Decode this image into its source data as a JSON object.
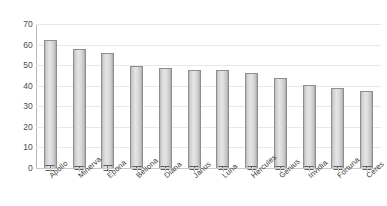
{
  "chart_data": {
    "type": "bar",
    "title": "",
    "subtitle": "",
    "xlabel": "",
    "ylabel": "",
    "categories": [
      "Apollo",
      "Minerva",
      "Epona",
      "Bellona",
      "Diana",
      "Janus",
      "Luna",
      "Hercules",
      "Genius",
      "Invidia",
      "Fortuna",
      "Ceres"
    ],
    "values": [
      62,
      58,
      56,
      49.5,
      48.5,
      47.5,
      47.5,
      46,
      44,
      40.5,
      39,
      37.5
    ],
    "errors": [
      1.6,
      1.2,
      1.3,
      1.1,
      1.1,
      1.0,
      1.1,
      1.0,
      1.0,
      1.0,
      1.0,
      1.0
    ],
    "ylim": [
      0,
      70
    ],
    "ytick_values": [
      0,
      10,
      20,
      30,
      40,
      50,
      60,
      70
    ],
    "ytick_labels": [
      "0",
      "10",
      "20",
      "30",
      "40",
      "50",
      "60",
      "70"
    ],
    "grid": true,
    "grid_axis": "y",
    "legend": false,
    "legend_position": "none",
    "error_bars": true,
    "bar_color": "#dcdcdc",
    "bar_edge_color": "#8e8e8e",
    "grid_color": "#e8e8e8",
    "axis_color": "#b8b8b8",
    "text_color": "#4a4a4a",
    "background_color": "#ffffff"
  }
}
